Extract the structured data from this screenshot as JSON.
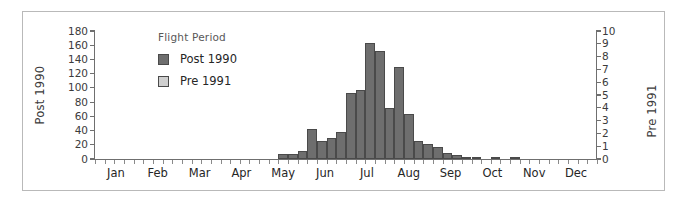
{
  "figure": {
    "background": "#ffffff",
    "frame_color": "#b9b9b9"
  },
  "axis_titles": {
    "left": "Post 1990",
    "right": "Pre 1991"
  },
  "legend": {
    "title": "Flight Period",
    "entries": [
      {
        "label": "Post 1990",
        "color": "#6e6e6e"
      },
      {
        "label": "Pre 1991",
        "color": "#cfcfcf"
      }
    ]
  },
  "chart_data": {
    "type": "bar",
    "title": "",
    "subtitle": "",
    "xlabel": "",
    "ylabel": "Post 1990",
    "y2label": "Pre 1991",
    "ylim": [
      0,
      180
    ],
    "y2lim": [
      0,
      10
    ],
    "yticks": [
      0,
      20,
      40,
      60,
      80,
      100,
      120,
      140,
      160,
      180
    ],
    "y2ticks": [
      0,
      1,
      2,
      3,
      4,
      5,
      6,
      7,
      8,
      9,
      10
    ],
    "grid": false,
    "legend_position": "upper-left-inside",
    "xtick_labels": [
      "Jan",
      "Feb",
      "Mar",
      "Apr",
      "May",
      "Jun",
      "Jul",
      "Aug",
      "Sep",
      "Oct",
      "Nov",
      "Dec"
    ],
    "bin_width_note": "weekly bins across the year; 52 bins",
    "series": [
      {
        "name": "Post 1990",
        "color": "#6e6e6e",
        "axis": "left",
        "bins": [
          {
            "bin": 19,
            "x": "mid May",
            "value": 7
          },
          {
            "bin": 20,
            "x": "late May",
            "value": 7
          },
          {
            "bin": 21,
            "x": "late May",
            "value": 11
          },
          {
            "bin": 22,
            "x": "early Jun",
            "value": 42
          },
          {
            "bin": 23,
            "x": "early Jun",
            "value": 26
          },
          {
            "bin": 24,
            "x": "mid Jun",
            "value": 30
          },
          {
            "bin": 25,
            "x": "late Jun",
            "value": 38
          },
          {
            "bin": 26,
            "x": "late Jun",
            "value": 93
          },
          {
            "bin": 27,
            "x": "early Jul",
            "value": 97
          },
          {
            "bin": 28,
            "x": "early Jul",
            "value": 163
          },
          {
            "bin": 29,
            "x": "mid Jul",
            "value": 152
          },
          {
            "bin": 30,
            "x": "mid Jul",
            "value": 72
          },
          {
            "bin": 31,
            "x": "late Jul",
            "value": 130
          },
          {
            "bin": 32,
            "x": "early Aug",
            "value": 64
          },
          {
            "bin": 33,
            "x": "early Aug",
            "value": 26
          },
          {
            "bin": 34,
            "x": "mid Aug",
            "value": 21
          },
          {
            "bin": 35,
            "x": "mid Aug",
            "value": 17
          },
          {
            "bin": 36,
            "x": "late Aug",
            "value": 8
          },
          {
            "bin": 37,
            "x": "early Sep",
            "value": 6
          },
          {
            "bin": 38,
            "x": "mid Sep",
            "value": 2
          },
          {
            "bin": 39,
            "x": "late Sep",
            "value": 2
          },
          {
            "bin": 41,
            "x": "early Oct",
            "value": 2
          },
          {
            "bin": 43,
            "x": "mid Oct",
            "value": 2
          }
        ]
      }
    ]
  }
}
